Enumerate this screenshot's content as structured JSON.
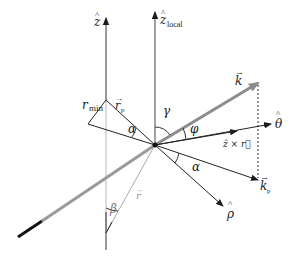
{
  "diagram": {
    "colors": {
      "dark": "#1a1a1a",
      "grey": "#9a9a9a",
      "light_grey": "#b0b0b0",
      "thick_grey": "#8c8c8c"
    },
    "labels": {
      "z": "z",
      "z_hat": "^",
      "z_local": "z",
      "z_local_sub": "local",
      "k": "k",
      "theta_hat": "θ",
      "z_cross_r": "ẑ × r⃗",
      "k_p": "k",
      "k_p_sub": "p",
      "rho_hat": "ρ",
      "r_min": "r",
      "r_min_sub": "min",
      "r_p": "r",
      "r_p_sub": "p",
      "r": "r",
      "alpha_upper": "α",
      "alpha_lower": "α",
      "gamma": "γ",
      "phi": "φ",
      "beta": "β"
    }
  }
}
